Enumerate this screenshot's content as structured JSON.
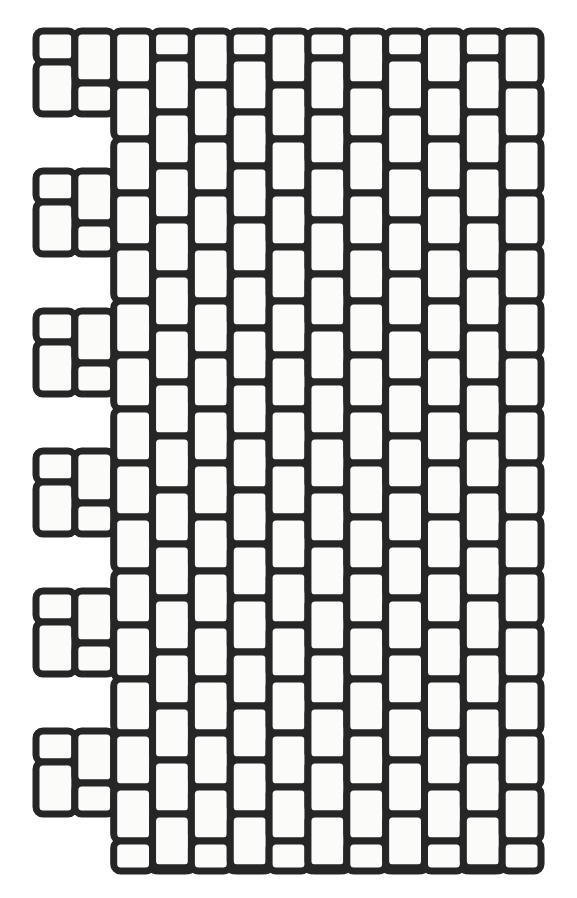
{
  "meta": {
    "canvas_width": 577,
    "canvas_height": 898
  },
  "colors": {
    "background": "#ffffff",
    "cell_fill": "#fbfbfa",
    "stroke": "#262626"
  },
  "geometry": {
    "origin_x": 36,
    "origin_y": 31,
    "grid_right": 541,
    "grid_bottom": 871,
    "column_count": 13,
    "column_width": 38.85,
    "cell_height": 54.0,
    "stroke_width": 7,
    "corner_radius": 7,
    "odd_column_offset": 27.0,
    "left_motif_period": 140.0,
    "left_motif_repeats": 6,
    "left_motif_short_height": 31,
    "left_motif_tall_height": 52
  },
  "columns": [
    {
      "index": 0,
      "name": "column-1-stepped",
      "mode": "motif",
      "offset": 0
    },
    {
      "index": 1,
      "name": "column-2-stepped",
      "mode": "motif-alt",
      "offset": 0
    },
    {
      "index": 2,
      "name": "column-3",
      "mode": "full",
      "offset": 0
    },
    {
      "index": 3,
      "name": "column-4",
      "mode": "full",
      "offset": 27
    },
    {
      "index": 4,
      "name": "column-5",
      "mode": "full",
      "offset": 0
    },
    {
      "index": 5,
      "name": "column-6",
      "mode": "full",
      "offset": 27
    },
    {
      "index": 6,
      "name": "column-7",
      "mode": "full",
      "offset": 0
    },
    {
      "index": 7,
      "name": "column-8",
      "mode": "full",
      "offset": 27
    },
    {
      "index": 8,
      "name": "column-9",
      "mode": "full",
      "offset": 0
    },
    {
      "index": 9,
      "name": "column-10",
      "mode": "full",
      "offset": 27
    },
    {
      "index": 10,
      "name": "column-11",
      "mode": "full",
      "offset": 0
    },
    {
      "index": 11,
      "name": "column-12",
      "mode": "full",
      "offset": 27
    },
    {
      "index": 12,
      "name": "column-13",
      "mode": "full",
      "offset": 0
    }
  ],
  "left_motif_blocks": [
    {
      "index": 0,
      "top": 31
    },
    {
      "index": 1,
      "top": 171
    },
    {
      "index": 2,
      "top": 311
    },
    {
      "index": 3,
      "top": 451
    },
    {
      "index": 4,
      "top": 591
    },
    {
      "index": 5,
      "top": 731
    }
  ]
}
